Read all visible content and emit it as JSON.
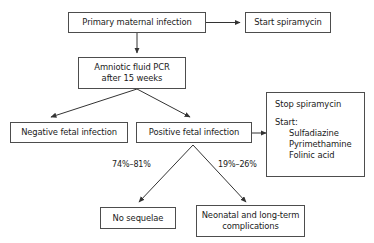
{
  "diagram": {
    "nodes": [
      {
        "id": "primary_infection",
        "label": "Primary maternal infection"
      },
      {
        "id": "start_spiramycin",
        "label": "Start spiramycin"
      },
      {
        "id": "amniotic_pcr_line1",
        "label": "Amniotic fluid PCR"
      },
      {
        "id": "amniotic_pcr_line2",
        "label": "after 15 weeks"
      },
      {
        "id": "negative_infection",
        "label": "Negative fetal infection"
      },
      {
        "id": "positive_infection",
        "label": "Positive fetal infection"
      },
      {
        "id": "no_sequelae",
        "label": "No sequelae"
      },
      {
        "id": "complications_line1",
        "label": "Neonatal and long-term"
      },
      {
        "id": "complications_line2",
        "label": "complications"
      }
    ],
    "treatment_box": {
      "stop_line": "Stop spiramycin",
      "start_line": "Start:",
      "drugs": [
        "Sulfadiazine",
        "Pyrimethamine",
        "Folinic acid"
      ]
    },
    "edge_labels": {
      "left_branch": "74%–81%",
      "right_branch": "19%–26%"
    },
    "colors": {
      "border": "#4d4d4d",
      "text": "#1a1a1a",
      "arrow": "#333333",
      "background": "#ffffff"
    }
  }
}
